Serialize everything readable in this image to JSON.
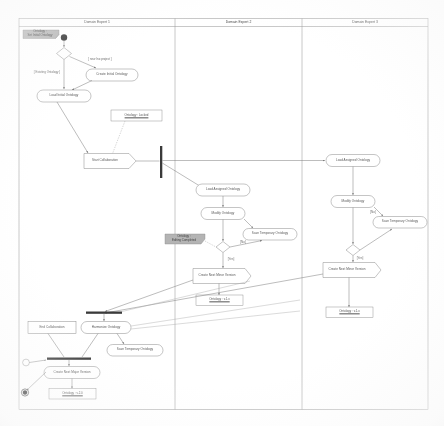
{
  "diagram": {
    "type": "uml-activity-diagram",
    "background": "#ffffff",
    "line_color": "#777777",
    "note_fill": "#b0b0b0"
  },
  "swimlanes": [
    {
      "id": "lane1",
      "header": "Domain Expert 1"
    },
    {
      "id": "lane2",
      "header": "Domain Expert 2"
    },
    {
      "id": "lane3",
      "header": "Domain Expert 3"
    }
  ],
  "nodes": {
    "start": {
      "label": "",
      "type": "initial-node"
    },
    "end": {
      "label": "",
      "type": "final-node"
    },
    "decision_project": {
      "label": "",
      "type": "decision"
    },
    "decision_done_2": {
      "label": "",
      "type": "decision"
    },
    "decision_done_3": {
      "label": "",
      "type": "decision"
    },
    "create_initial": {
      "label": "Create Initial Ontology",
      "type": "action"
    },
    "load_initial": {
      "label": "Load Initial Ontology",
      "type": "action"
    },
    "start_collab": {
      "label": "Start Collaboration",
      "type": "signal-send"
    },
    "load_assigned_2": {
      "label": "Load Assigned Ontology",
      "type": "action"
    },
    "modify_2": {
      "label": "Modify Ontology",
      "type": "action"
    },
    "save_temp_2": {
      "label": "Save Temporary Ontology",
      "type": "action"
    },
    "create_minor_2": {
      "label": "Create Next Minor Version",
      "type": "signal-send"
    },
    "load_assigned_3": {
      "label": "Load Assigned Ontology",
      "type": "action"
    },
    "modify_3": {
      "label": "Modify Ontology",
      "type": "action"
    },
    "save_temp_3": {
      "label": "Save Temporary Ontology",
      "type": "action"
    },
    "create_minor_3": {
      "label": "Create Next Minor Version",
      "type": "signal-send"
    },
    "end_collab": {
      "label": "End Collaboration",
      "type": "signal-send"
    },
    "harmonize": {
      "label": "Harmonize Ontology",
      "type": "action"
    },
    "save_temp_1": {
      "label": "Save Temporary Ontology",
      "type": "action"
    },
    "create_major": {
      "label": "Create Next Major Version",
      "type": "action"
    }
  },
  "notes": [
    {
      "id": "note_onto_locked",
      "label": "Ontology : Locked"
    },
    {
      "id": "note_minor_2",
      "label": "Ontology : v.1.x"
    },
    {
      "id": "note_minor_3",
      "label": "Ontology : v.1.x"
    },
    {
      "id": "note_major_1",
      "label": "Ontology : v.2.0"
    }
  ],
  "gray_notes": [
    {
      "id": "gnote_start",
      "line1": "Ontology :",
      "line2": "Set Initial Ontology"
    },
    {
      "id": "gnote_editing",
      "line1": "Ontology :",
      "line2": "Editing Completed"
    }
  ],
  "guards": [
    {
      "id": "guard_new",
      "label": "[ new /no project ]"
    },
    {
      "id": "guard_existing",
      "label": "[ Existing Ontology ]"
    },
    {
      "id": "guard_no_2",
      "label": "[No]"
    },
    {
      "id": "guard_yes_2",
      "label": "[Yes]"
    },
    {
      "id": "guard_no_3",
      "label": "[No]"
    },
    {
      "id": "guard_yes_3",
      "label": "[Yes]"
    }
  ],
  "bars": [
    {
      "id": "fork_main",
      "orientation": "vertical"
    },
    {
      "id": "join_collab",
      "orientation": "horizontal"
    },
    {
      "id": "join_final",
      "orientation": "horizontal"
    }
  ]
}
